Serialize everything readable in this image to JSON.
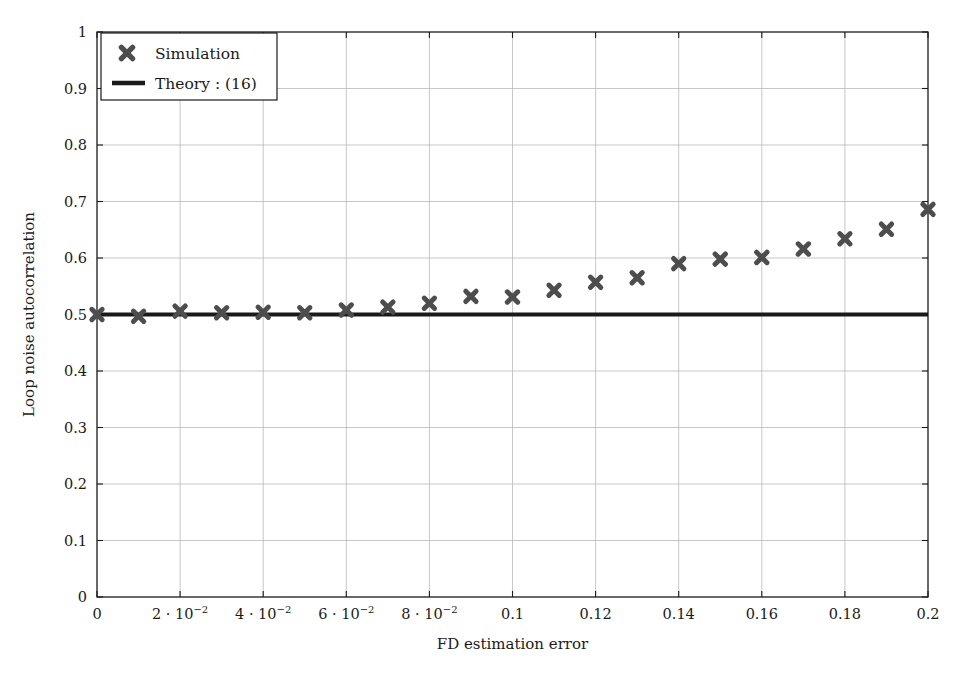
{
  "chart_data": {
    "type": "scatter",
    "title": "",
    "xlabel": "FD estimation error",
    "ylabel": "Loop noise autocorrelation",
    "xlim": [
      0,
      0.2
    ],
    "ylim": [
      0,
      1
    ],
    "grid": true,
    "legend_position": "top-left",
    "x_tick_values": [
      0,
      0.02,
      0.04,
      0.06,
      0.08,
      0.1,
      0.12,
      0.14,
      0.16,
      0.18,
      0.2
    ],
    "x_tick_labels": [
      "0",
      "2 · 10⁻²",
      "4 · 10⁻²",
      "6 · 10⁻²",
      "8 · 10⁻²",
      "0.1",
      "0.12",
      "0.14",
      "0.16",
      "0.18",
      "0.2"
    ],
    "x_tick_parts": [
      {
        "mantissa": "0",
        "exp": ""
      },
      {
        "mantissa": "2 · 10",
        "exp": "−2"
      },
      {
        "mantissa": "4 · 10",
        "exp": "−2"
      },
      {
        "mantissa": "6 · 10",
        "exp": "−2"
      },
      {
        "mantissa": "8 · 10",
        "exp": "−2"
      },
      {
        "mantissa": "0.1",
        "exp": ""
      },
      {
        "mantissa": "0.12",
        "exp": ""
      },
      {
        "mantissa": "0.14",
        "exp": ""
      },
      {
        "mantissa": "0.16",
        "exp": ""
      },
      {
        "mantissa": "0.18",
        "exp": ""
      },
      {
        "mantissa": "0.2",
        "exp": ""
      }
    ],
    "y_tick_values": [
      0,
      0.1,
      0.2,
      0.3,
      0.4,
      0.5,
      0.6,
      0.7,
      0.8,
      0.9,
      1
    ],
    "y_tick_labels": [
      "0",
      "0.1",
      "0.2",
      "0.3",
      "0.4",
      "0.5",
      "0.6",
      "0.7",
      "0.8",
      "0.9",
      "1"
    ],
    "series": [
      {
        "name": "Simulation",
        "style": "markers",
        "marker": "x-bold",
        "color": "#4d4d4d",
        "x": [
          0,
          0.01,
          0.02,
          0.03,
          0.04,
          0.05,
          0.06,
          0.07,
          0.08,
          0.09,
          0.1,
          0.11,
          0.12,
          0.13,
          0.14,
          0.15,
          0.16,
          0.17,
          0.18,
          0.19,
          0.2
        ],
        "values": [
          0.5,
          0.497,
          0.506,
          0.503,
          0.504,
          0.503,
          0.508,
          0.513,
          0.52,
          0.532,
          0.531,
          0.543,
          0.557,
          0.565,
          0.59,
          0.598,
          0.601,
          0.616,
          0.634,
          0.651,
          0.686
        ]
      },
      {
        "name": "Theory : (16)",
        "style": "line",
        "color": "#1a1a1a",
        "x": [
          0,
          0.2
        ],
        "values": [
          0.5,
          0.5
        ]
      }
    ]
  },
  "legend": {
    "entries": [
      {
        "label": "Simulation",
        "marker": "x-marker",
        "color": "#4d4d4d"
      },
      {
        "label": "Theory : (16)",
        "marker": "line-marker",
        "color": "#1a1a1a"
      }
    ]
  },
  "colors": {
    "axis": "#1a1a1a",
    "grid": "#b9b9b9",
    "marker": "#4d4d4d",
    "line": "#1a1a1a",
    "background": "#ffffff"
  }
}
